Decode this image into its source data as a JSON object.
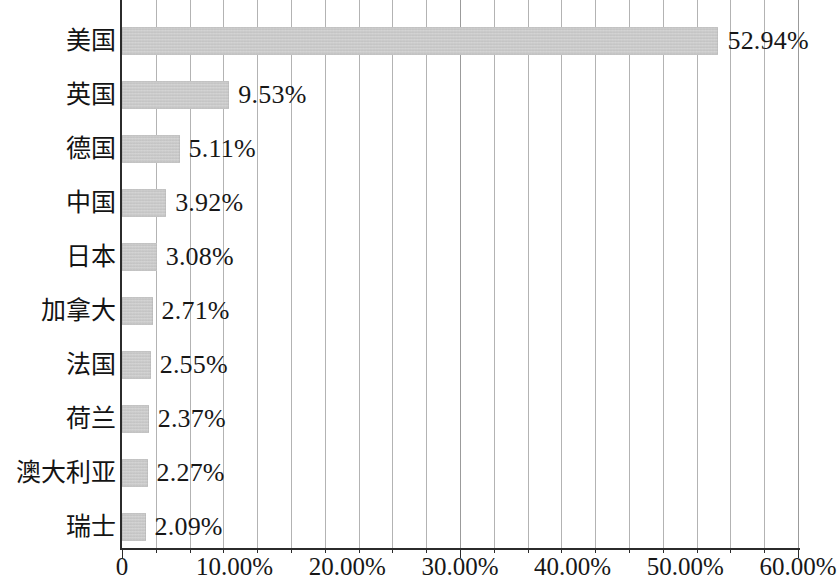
{
  "chart_data": {
    "type": "bar",
    "orientation": "horizontal",
    "title": "",
    "subtitle": "",
    "xlabel": "",
    "ylabel": "",
    "xlim": [
      0,
      60
    ],
    "grid": true,
    "legend": null,
    "value_suffix": "%",
    "categories": [
      "美国",
      "英国",
      "德国",
      "中国",
      "日本",
      "加拿大",
      "法国",
      "荷兰",
      "澳大利亚",
      "瑞士"
    ],
    "values": [
      52.94,
      9.53,
      5.11,
      3.92,
      3.08,
      2.71,
      2.55,
      2.37,
      2.27,
      2.09
    ],
    "value_labels": [
      "52.94%",
      "9.53%",
      "5.11%",
      "3.92%",
      "3.08%",
      "2.71%",
      "2.55%",
      "2.37%",
      "2.27%",
      "2.09%"
    ],
    "x_ticks": [
      0,
      10,
      20,
      30,
      40,
      50,
      60
    ],
    "x_tick_labels": [
      "0",
      "10.00%",
      "20.00%",
      "30.00%",
      "40.00%",
      "50.00%",
      "60.00%"
    ],
    "x_minor_step": 3,
    "bar_color": "#c9c9c9",
    "axis_color": "#2b2b2b",
    "grid_color": "#9a9a9a"
  }
}
